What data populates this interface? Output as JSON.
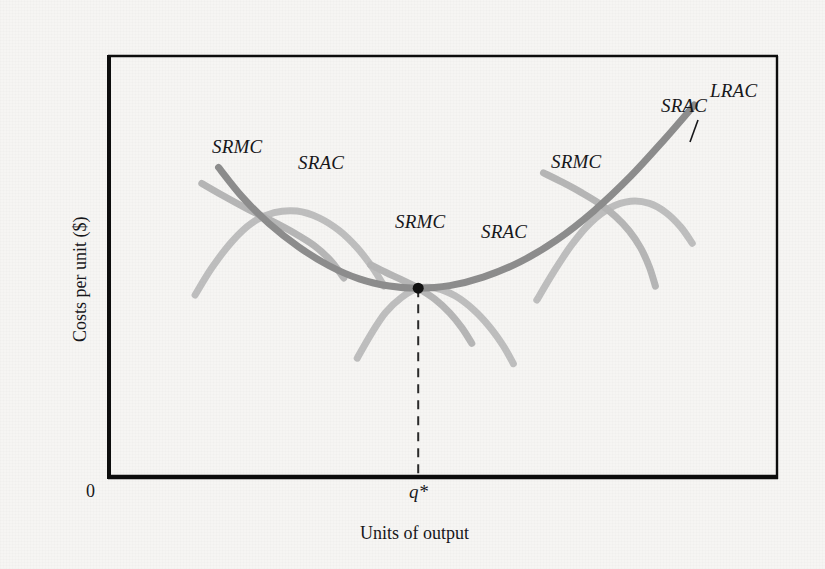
{
  "figure": {
    "background_color": "#f6f5f3",
    "frame_color": "#0d0d0d",
    "lrac_color": "#8c8c8c",
    "srac_color": "#bdbdbd",
    "srmc_color": "#b5b5b5",
    "point_color": "#111111",
    "dash_color": "#2a2a2a"
  },
  "axes": {
    "y_title": "Costs per unit ($)",
    "x_title": "Units of output",
    "origin_label": "0",
    "x_tick_label": "q*",
    "grid": "off",
    "frame": {
      "left": 108,
      "top": 55,
      "right": 778,
      "bottom": 479
    }
  },
  "labels": {
    "srmc_left": "SRMC",
    "srac_left": "SRAC",
    "srmc_mid": "SRMC",
    "srac_mid": "SRAC",
    "srmc_right": "SRMC",
    "srac_right": "SRAC",
    "lrac": "LRAC"
  },
  "chart_data": {
    "type": "line",
    "title": "",
    "xlabel": "Units of output",
    "ylabel": "Costs per unit ($)",
    "xlim": [
      0,
      1
    ],
    "ylim": [
      0,
      1
    ],
    "grid": false,
    "legend": "inline-curve-labels",
    "annotations": [
      {
        "text": "q*",
        "x": 0.463,
        "y": 0.0,
        "note": "minimum-efficient-scale output on x-axis"
      },
      {
        "text": "tangency point",
        "x": 0.463,
        "y": 0.45,
        "note": "LRAC minimum where SRAC is tangent and SRMC crosses"
      }
    ],
    "series": [
      {
        "name": "LRAC",
        "role": "long-run-average-cost",
        "color": "#8c8c8c",
        "width": 7,
        "points": [
          [
            0.165,
            0.735
          ],
          [
            0.2,
            0.666
          ],
          [
            0.24,
            0.603
          ],
          [
            0.285,
            0.547
          ],
          [
            0.33,
            0.503
          ],
          [
            0.375,
            0.472
          ],
          [
            0.42,
            0.455
          ],
          [
            0.463,
            0.45
          ],
          [
            0.51,
            0.456
          ],
          [
            0.56,
            0.476
          ],
          [
            0.615,
            0.512
          ],
          [
            0.67,
            0.564
          ],
          [
            0.725,
            0.632
          ],
          [
            0.78,
            0.714
          ],
          [
            0.83,
            0.8
          ],
          [
            0.875,
            0.882
          ]
        ]
      },
      {
        "name": "SRAC-left",
        "role": "short-run-average-cost",
        "color": "#bdbdbd",
        "width": 7,
        "points": [
          [
            0.13,
            0.434
          ],
          [
            0.155,
            0.498
          ],
          [
            0.185,
            0.56
          ],
          [
            0.215,
            0.604
          ],
          [
            0.248,
            0.628
          ],
          [
            0.282,
            0.632
          ],
          [
            0.315,
            0.616
          ],
          [
            0.345,
            0.586
          ],
          [
            0.372,
            0.545
          ],
          [
            0.395,
            0.498
          ],
          [
            0.412,
            0.455
          ]
        ]
      },
      {
        "name": "SRMC-left",
        "role": "short-run-marginal-cost",
        "color": "#b5b5b5",
        "width": 7,
        "points": [
          [
            0.14,
            0.697
          ],
          [
            0.172,
            0.668
          ],
          [
            0.208,
            0.637
          ],
          [
            0.245,
            0.608
          ],
          [
            0.278,
            0.58
          ],
          [
            0.308,
            0.55
          ],
          [
            0.333,
            0.514
          ],
          [
            0.352,
            0.474
          ]
        ]
      },
      {
        "name": "SRAC-mid",
        "role": "short-run-average-cost",
        "color": "#bdbdbd",
        "width": 7,
        "points": [
          [
            0.372,
            0.285
          ],
          [
            0.392,
            0.34
          ],
          [
            0.414,
            0.392
          ],
          [
            0.438,
            0.428
          ],
          [
            0.463,
            0.45
          ],
          [
            0.49,
            0.45
          ],
          [
            0.518,
            0.432
          ],
          [
            0.545,
            0.4
          ],
          [
            0.57,
            0.358
          ],
          [
            0.59,
            0.314
          ],
          [
            0.605,
            0.272
          ]
        ]
      },
      {
        "name": "SRMC-mid",
        "role": "short-run-marginal-cost",
        "color": "#b5b5b5",
        "width": 7,
        "points": [
          [
            0.392,
            0.505
          ],
          [
            0.415,
            0.487
          ],
          [
            0.438,
            0.47
          ],
          [
            0.463,
            0.45
          ],
          [
            0.488,
            0.424
          ],
          [
            0.51,
            0.392
          ],
          [
            0.528,
            0.357
          ],
          [
            0.543,
            0.32
          ]
        ]
      },
      {
        "name": "SRAC-right",
        "role": "short-run-average-cost",
        "color": "#bdbdbd",
        "width": 7,
        "points": [
          [
            0.64,
            0.422
          ],
          [
            0.665,
            0.488
          ],
          [
            0.692,
            0.552
          ],
          [
            0.72,
            0.604
          ],
          [
            0.75,
            0.64
          ],
          [
            0.78,
            0.655
          ],
          [
            0.808,
            0.65
          ],
          [
            0.833,
            0.628
          ],
          [
            0.855,
            0.594
          ],
          [
            0.872,
            0.556
          ]
        ]
      },
      {
        "name": "SRMC-right",
        "role": "short-run-marginal-cost",
        "color": "#b5b5b5",
        "width": 7,
        "points": [
          [
            0.65,
            0.722
          ],
          [
            0.678,
            0.7
          ],
          [
            0.706,
            0.676
          ],
          [
            0.733,
            0.65
          ],
          [
            0.757,
            0.62
          ],
          [
            0.778,
            0.585
          ],
          [
            0.795,
            0.545
          ],
          [
            0.808,
            0.5
          ],
          [
            0.817,
            0.455
          ]
        ]
      }
    ],
    "markers": [
      {
        "name": "tangency-dot",
        "x": 0.463,
        "y": 0.45,
        "size": 11,
        "color": "#111111"
      }
    ],
    "reference_lines": [
      {
        "name": "qstar-dropline",
        "orientation": "vertical",
        "x": 0.463,
        "y_from": 0.45,
        "y_to": 0.0,
        "style": "dashed",
        "color": "#2a2a2a"
      }
    ]
  }
}
